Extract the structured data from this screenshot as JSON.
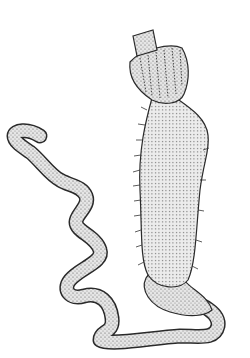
{
  "illustration": {
    "subject": "stippled scientific drawing of an elongated organism with a collared head and long coiled tail",
    "colors": {
      "background": "#ffffff",
      "ink": "#2a2a2a",
      "fill": "#d8d8d8",
      "stipple": "#555555"
    }
  }
}
